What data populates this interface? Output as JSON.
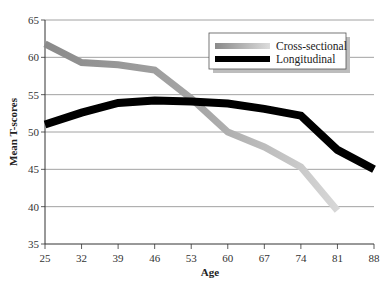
{
  "chart_data": {
    "type": "line",
    "title": "",
    "xlabel": "Age",
    "ylabel": "Mean T-scores",
    "x": [
      25,
      32,
      39,
      46,
      53,
      60,
      67,
      74,
      81,
      88
    ],
    "x_ticks": [
      "25",
      "32",
      "39",
      "46",
      "53",
      "60",
      "67",
      "74",
      "81",
      "88"
    ],
    "y_ticks": [
      "35",
      "40",
      "45",
      "50",
      "55",
      "60",
      "65"
    ],
    "ylim": [
      35,
      65
    ],
    "xlim": [
      25,
      88
    ],
    "grid": "horizontal",
    "legend_position": "upper right",
    "series": [
      {
        "name": "Cross-sectional",
        "color_start": "#8c8c8c",
        "color_end": "#d6d6d6",
        "values": [
          61.8,
          59.3,
          59.0,
          58.3,
          54.5,
          50.0,
          48.0,
          45.3,
          39.5,
          null
        ]
      },
      {
        "name": "Longitudinal",
        "color": "#000000",
        "values": [
          51.0,
          52.6,
          53.9,
          54.2,
          54.1,
          53.8,
          53.1,
          52.2,
          47.6,
          45.0
        ]
      }
    ]
  },
  "legend": {
    "items": [
      {
        "label": "Cross-sectional"
      },
      {
        "label": "Longitudinal"
      }
    ]
  }
}
